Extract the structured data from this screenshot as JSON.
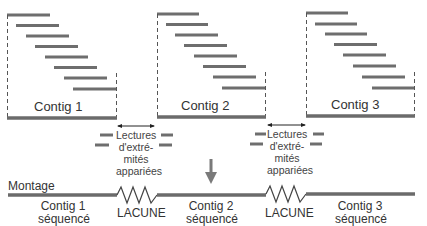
{
  "colors": {
    "read": "#6e6e6e",
    "contig": "#6b6b6b",
    "dashed": "#555555",
    "arrow": "#7a7a7a",
    "text": "#333333"
  },
  "contigs": [
    {
      "label": "Contig 1",
      "x0": 9,
      "x1": 117,
      "bar_y": 118,
      "reads_x0": 9,
      "read_len": 42,
      "read_step": 9.5
    },
    {
      "label": "Contig 2",
      "x0": 157,
      "x1": 265,
      "bar_y": 118,
      "reads_x0": 157,
      "read_len": 42,
      "read_step": 9.5
    },
    {
      "label": "Contig 3",
      "x0": 306,
      "x1": 414,
      "bar_y": 117,
      "reads_x0": 306,
      "read_len": 42,
      "read_step": 9.5
    }
  ],
  "paired_ends": [
    {
      "label_lines": [
        "Lectures",
        "d'extré-",
        "mités",
        "appariées"
      ]
    },
    {
      "label_lines": [
        "Lectures",
        "d'extré-",
        "mités",
        "appariées"
      ]
    }
  ],
  "assembly": {
    "title": "Montage",
    "segments": [
      {
        "label_lines": [
          "Contig 1",
          "séquencé"
        ]
      },
      {
        "label": "LACUNE"
      },
      {
        "label_lines": [
          "Contig 2",
          "séquencé"
        ]
      },
      {
        "label": "LACUNE"
      },
      {
        "label_lines": [
          "Contig 3",
          "séquencé"
        ]
      }
    ]
  }
}
